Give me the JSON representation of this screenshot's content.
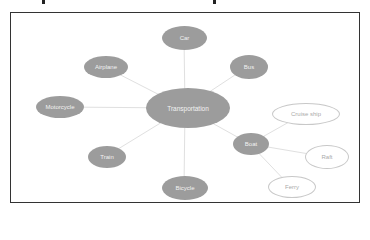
{
  "diagram": {
    "center": {
      "id": "transportation",
      "label": "Transportation"
    },
    "nodes": [
      {
        "id": "car",
        "label": "Car",
        "style": "filled",
        "parent": "transportation"
      },
      {
        "id": "bus",
        "label": "Bus",
        "style": "filled",
        "parent": "transportation"
      },
      {
        "id": "airplane",
        "label": "Airplane",
        "style": "filled",
        "parent": "transportation"
      },
      {
        "id": "motorcycle",
        "label": "Motorcycle",
        "style": "filled",
        "parent": "transportation"
      },
      {
        "id": "train",
        "label": "Train",
        "style": "filled",
        "parent": "transportation"
      },
      {
        "id": "bicycle",
        "label": "Bicycle",
        "style": "filled",
        "parent": "transportation"
      },
      {
        "id": "boat",
        "label": "Boat",
        "style": "filled",
        "parent": "transportation"
      },
      {
        "id": "cruise_ship",
        "label": "Cruise ship",
        "style": "hollow",
        "parent": "boat"
      },
      {
        "id": "raft",
        "label": "Raft",
        "style": "hollow",
        "parent": "boat"
      },
      {
        "id": "ferry",
        "label": "Ferry",
        "style": "hollow",
        "parent": "boat"
      }
    ],
    "colors": {
      "filled": "#9c9c9c",
      "hollow_border": "#c8c8c8",
      "edge": "#e0e0e0",
      "frame": "#333333"
    }
  }
}
